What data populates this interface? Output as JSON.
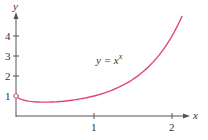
{
  "chart_data": {
    "type": "line",
    "title": "",
    "xlabel": "x",
    "ylabel": "y",
    "xlim": [
      0,
      2.13
    ],
    "ylim": [
      0,
      5
    ],
    "grid": false,
    "legend": null,
    "x_ticks": [
      1,
      2
    ],
    "x_tick_labels": [
      "1",
      "2"
    ],
    "y_ticks": [
      1,
      2,
      3,
      4
    ],
    "y_tick_labels": [
      "1",
      "2",
      "3",
      "4"
    ],
    "annotations": [
      {
        "text": "y = x",
        "superscript": "x",
        "x": 1.05,
        "y": 2.7
      }
    ],
    "open_point": {
      "x": 0,
      "y": 1
    },
    "series": [
      {
        "name": "y = x^x",
        "color": "#e0457a",
        "x": [
          0.0,
          0.05,
          0.1,
          0.2,
          0.3,
          0.3679,
          0.5,
          0.7,
          1.0,
          1.2,
          1.4,
          1.6,
          1.8,
          2.0,
          2.13
        ],
        "values": [
          1.0,
          0.861,
          0.794,
          0.725,
          0.697,
          0.692,
          0.707,
          0.779,
          1.0,
          1.245,
          1.602,
          2.121,
          2.88,
          4.0,
          5.0
        ]
      }
    ]
  },
  "labels": {
    "y_axis": "y",
    "x_axis": "x",
    "equation_base": "y = x",
    "equation_exp": "x",
    "xt1": "1",
    "xt2": "2",
    "yt1": "1",
    "yt2": "2",
    "yt3": "3",
    "yt4": "4"
  },
  "colors": {
    "curve": "#e0457a",
    "axis": "#555555"
  }
}
